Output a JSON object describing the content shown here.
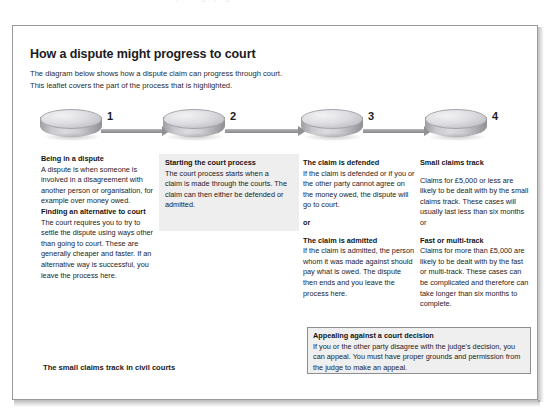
{
  "scan": {
    "top_cut_text": "a dispute might progress to court"
  },
  "document": {
    "heading": "How a dispute might progress to court",
    "intro_line1": "The diagram below shows how a dispute claim can progress through court.",
    "intro_line2": "This leaflet covers the part of the process that is highlighted.",
    "footer_note": "The small claims track in civil courts"
  },
  "flow": {
    "steps": [
      {
        "number": "1",
        "icon": "process-puck-icon"
      },
      {
        "number": "2",
        "icon": "process-puck-icon"
      },
      {
        "number": "3",
        "icon": "process-puck-icon"
      },
      {
        "number": "4",
        "icon": "process-puck-icon"
      }
    ],
    "connectors": [
      {
        "icon": "arrow-right-icon"
      },
      {
        "icon": "arrow-right-icon"
      },
      {
        "icon": "arrow-right-icon"
      }
    ]
  },
  "columns": [
    {
      "step": "1",
      "highlighted": false,
      "blocks": [
        {
          "heading": "Being in a dispute",
          "body": "A dispute is when someone is involved in a disagreement with another person or organisation, for example over money owed."
        },
        {
          "heading": "Finding an alternative to court",
          "body": "The court requires you to try to settle the dispute using ways other than going to court. These are generally cheaper and faster. If an alternative way is successful, you leave the process here."
        }
      ]
    },
    {
      "step": "2",
      "highlighted": true,
      "blocks": [
        {
          "heading": "Starting the court process",
          "body": "The court process starts when a claim is made through the courts. The claim can then either be defended  or admitted."
        }
      ]
    },
    {
      "step": "3",
      "highlighted": false,
      "blocks": [
        {
          "heading": "The claim is defended",
          "body": "If the claim is defended or if you or the other party cannot agree on the money owed, the dispute will go to court."
        },
        {
          "heading": "or",
          "body": ""
        },
        {
          "heading": "The claim is admitted",
          "body": "If the claim is admitted, the person whom it was made against should pay what is owed. The dispute then ends and you leave the process here."
        }
      ]
    },
    {
      "step": "4",
      "highlighted": false,
      "blocks": [
        {
          "heading": "Small claims track",
          "body": "Claims for £5,000 or less are likely to be dealt with by the small claims track. These cases will usually last less than six months or"
        },
        {
          "heading": "Fast or multi-track",
          "body": "Claims for more than £5,000 are likely to be dealt with by the fast or multi-track. These cases can be complicated and therefore can take longer than six months to complete."
        }
      ]
    }
  ],
  "appeal_box": {
    "heading": "Appealing against a court decision",
    "body": "If you or the other party disagree with the judge's decision, you can appeal. You must have proper grounds and permission from the judge to make an appeal."
  }
}
